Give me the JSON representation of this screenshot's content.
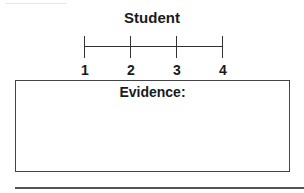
{
  "form": {
    "title": "Student",
    "scale": {
      "ticks": [
        {
          "label": "1",
          "x": 84
        },
        {
          "label": "2",
          "x": 130
        },
        {
          "label": "3",
          "x": 176
        },
        {
          "label": "4",
          "x": 222
        }
      ]
    },
    "evidence": {
      "label": "Evidence:"
    }
  }
}
